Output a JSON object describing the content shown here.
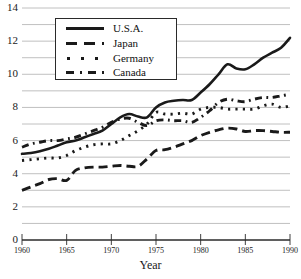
{
  "chart_data": {
    "type": "line",
    "title": "",
    "xlabel": "Year",
    "ylabel": "",
    "xlim": [
      1960,
      1990
    ],
    "ylim": [
      0,
      14
    ],
    "grid": true,
    "legend_position": "upper-left",
    "y_ticks": [
      0,
      2,
      4,
      6,
      8,
      10,
      12,
      14
    ],
    "y_tick_labels": [
      "0",
      "2",
      "4",
      "6",
      "8",
      "10",
      "12",
      "14"
    ],
    "y_gridlines": [
      0,
      1,
      2,
      3,
      4,
      5,
      6,
      7,
      8,
      9,
      10,
      11,
      12,
      13,
      14
    ],
    "x_ticks": [
      1960,
      1965,
      1970,
      1975,
      1980,
      1985,
      1990
    ],
    "x_tick_labels": [
      "1960",
      "1965",
      "1970",
      "1975",
      "1980",
      "1985",
      "1990"
    ],
    "x": [
      1960,
      1961,
      1962,
      1963,
      1964,
      1965,
      1966,
      1967,
      1968,
      1969,
      1970,
      1971,
      1972,
      1973,
      1974,
      1975,
      1976,
      1977,
      1978,
      1979,
      1980,
      1981,
      1982,
      1983,
      1984,
      1985,
      1986,
      1987,
      1988,
      1989,
      1990
    ],
    "series": [
      {
        "name": "U.S.A.",
        "style": "solid",
        "color": "#1a1a1a",
        "values": [
          5.2,
          5.25,
          5.35,
          5.5,
          5.7,
          5.9,
          6.0,
          6.2,
          6.4,
          6.6,
          7.0,
          7.4,
          7.6,
          7.45,
          7.4,
          8.0,
          8.3,
          8.4,
          8.45,
          8.45,
          8.9,
          9.4,
          10.0,
          10.6,
          10.35,
          10.3,
          10.6,
          11.0,
          11.3,
          11.6,
          12.2
        ]
      },
      {
        "name": "Japan",
        "style": "dashed",
        "color": "#1a1a1a",
        "values": [
          3.0,
          3.2,
          3.4,
          3.65,
          3.7,
          3.6,
          4.2,
          4.35,
          4.4,
          4.4,
          4.45,
          4.5,
          4.45,
          4.45,
          4.9,
          5.4,
          5.45,
          5.6,
          5.8,
          6.0,
          6.3,
          6.5,
          6.65,
          6.75,
          6.7,
          6.55,
          6.6,
          6.6,
          6.55,
          6.5,
          6.5
        ]
      },
      {
        "name": "Germany",
        "style": "dotted",
        "color": "#1a1a1a",
        "values": [
          4.8,
          4.85,
          4.9,
          4.95,
          4.95,
          5.1,
          5.4,
          5.6,
          5.75,
          5.8,
          5.8,
          6.0,
          6.3,
          6.6,
          7.0,
          7.7,
          7.6,
          7.6,
          7.65,
          7.6,
          7.9,
          8.0,
          8.0,
          7.9,
          7.9,
          7.9,
          7.9,
          8.1,
          8.2,
          8.0,
          8.1
        ]
      },
      {
        "name": "Canada",
        "style": "dashdot",
        "color": "#1a1a1a",
        "values": [
          5.6,
          5.8,
          5.9,
          6.0,
          6.0,
          6.1,
          6.2,
          6.4,
          6.6,
          6.8,
          7.1,
          7.3,
          7.35,
          7.1,
          6.9,
          7.2,
          7.25,
          7.2,
          7.2,
          7.1,
          7.4,
          7.8,
          8.3,
          8.5,
          8.4,
          8.35,
          8.5,
          8.6,
          8.6,
          8.7,
          8.8
        ]
      }
    ]
  },
  "legend": {
    "entries": [
      {
        "label": "U.S.A."
      },
      {
        "label": "Japan"
      },
      {
        "label": "Germany"
      },
      {
        "label": "Canada"
      }
    ]
  },
  "axes": {
    "x_title": "Year"
  }
}
